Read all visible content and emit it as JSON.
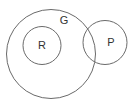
{
  "diagram": {
    "type": "venn",
    "sets": [
      {
        "id": "G",
        "label": "G",
        "cx": 51,
        "cy": 54,
        "r": 44.5,
        "label_x": 64,
        "label_y": 24
      },
      {
        "id": "R",
        "label": "R",
        "cx": 42,
        "cy": 45.5,
        "r": 19,
        "label_x": 42,
        "label_y": 49
      },
      {
        "id": "P",
        "label": "P",
        "cx": 105,
        "cy": 42.5,
        "r": 22,
        "label_x": 111,
        "label_y": 46
      }
    ],
    "relations": [
      {
        "from": "R",
        "to": "G",
        "kind": "subset"
      },
      {
        "from": "P",
        "to": "G",
        "kind": "partial-overlap"
      }
    ],
    "colors": {
      "stroke": "#6a6a6a",
      "text": "#333333",
      "background": "#ffffff"
    }
  }
}
